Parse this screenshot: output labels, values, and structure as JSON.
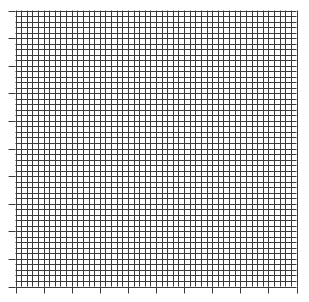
{
  "chart_data": {
    "type": "scatter",
    "title": "",
    "xlabel": "",
    "ylabel": "",
    "x_tick_labels": [],
    "y_tick_labels": [],
    "series": [],
    "grid": {
      "on": true,
      "major_divisions_x": 10,
      "major_divisions_y": 10,
      "minor_per_major": 5,
      "line_color": "#3a3a3a"
    },
    "axis_color": "#3a3a3a",
    "plot_area": {
      "left": 15.5,
      "top": 10.5,
      "right": 296.5,
      "bottom": 286.5
    },
    "tick_length": 7,
    "legend": null
  }
}
